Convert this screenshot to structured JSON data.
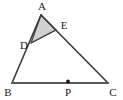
{
  "figure": {
    "type": "geometry-diagram",
    "canvas": {
      "width": 123,
      "height": 100,
      "background": "#ffffff"
    },
    "style": {
      "stroke_color": "#3a3a3a",
      "base_stroke_color": "#5a5a5a",
      "stroke_width": 1.6,
      "base_stroke_width": 2.0,
      "shade_fill": "#d0d0d0",
      "shade_stroke": "#4a4a4a",
      "point_color": "#1a1a1a",
      "label_color": "#1a1a1a"
    },
    "points": [
      {
        "id": "A",
        "label": "A",
        "x": 41,
        "y": 15,
        "label_x": 42,
        "label_y": 10,
        "anchor": "middle",
        "marked": false
      },
      {
        "id": "B",
        "label": "B",
        "x": 12,
        "y": 83,
        "label_x": 8,
        "label_y": 96,
        "anchor": "middle",
        "marked": false
      },
      {
        "id": "C",
        "label": "C",
        "x": 108,
        "y": 83,
        "label_x": 113,
        "label_y": 96,
        "anchor": "middle",
        "marked": false
      },
      {
        "id": "D",
        "label": "D",
        "x": 31,
        "y": 43,
        "label_x": 24,
        "label_y": 48,
        "anchor": "middle",
        "marked": false
      },
      {
        "id": "E",
        "label": "E",
        "x": 56,
        "y": 30,
        "label_x": 63,
        "label_y": 28,
        "anchor": "middle",
        "marked": false
      },
      {
        "id": "P",
        "label": "P",
        "x": 68,
        "y": 83,
        "label_x": 68,
        "label_y": 96,
        "anchor": "middle",
        "marked": true
      }
    ],
    "segments": [
      {
        "id": "AB",
        "from": "A",
        "to": "B",
        "kind": "side"
      },
      {
        "id": "AC",
        "from": "A",
        "to": "C",
        "kind": "side"
      },
      {
        "id": "BC",
        "from": "B",
        "to": "C",
        "kind": "base"
      },
      {
        "id": "DE",
        "from": "D",
        "to": "E",
        "kind": "cevian"
      }
    ],
    "shaded_region": {
      "id": "ADE",
      "vertices": [
        "A",
        "D",
        "E"
      ],
      "fill": "#d0d0d0"
    },
    "labels": {
      "A": "A",
      "B": "B",
      "C": "C",
      "D": "D",
      "E": "E",
      "P": "P"
    }
  }
}
